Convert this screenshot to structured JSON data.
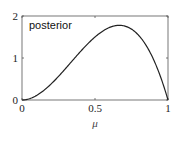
{
  "chart_data": {
    "type": "line",
    "title": "",
    "xlabel": "μ",
    "ylabel": "",
    "xlim": [
      0,
      1
    ],
    "ylim": [
      0,
      2
    ],
    "xticks": [
      0,
      0.5,
      1
    ],
    "xtick_labels": [
      "0",
      "0.5",
      "1"
    ],
    "yticks": [
      0,
      1,
      2
    ],
    "ytick_labels": [
      "0",
      "1",
      "2"
    ],
    "grid": false,
    "annotation": "posterior",
    "series": [
      {
        "name": "posterior",
        "color": "#222222",
        "x": [
          0,
          0.1,
          0.2,
          0.3,
          0.4,
          0.5,
          0.6,
          0.667,
          0.7,
          0.8,
          0.9,
          1.0
        ],
        "y": [
          0,
          0.108,
          0.384,
          0.756,
          1.152,
          1.5,
          1.728,
          1.778,
          1.764,
          1.536,
          0.972,
          0
        ]
      }
    ]
  }
}
